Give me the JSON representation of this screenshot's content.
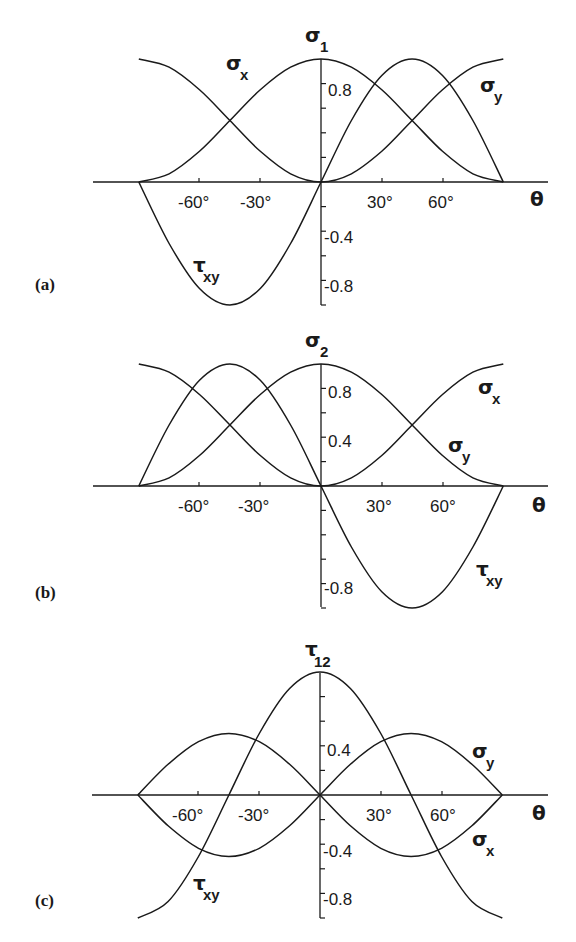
{
  "chart_data": [
    {
      "type": "line",
      "panel_label": "(a)",
      "title": "σ1",
      "ylabel": "σ1",
      "xlabel": "θ",
      "xlim": [
        -90,
        90
      ],
      "ylim": [
        -1.0,
        1.0
      ],
      "grid": false,
      "x_ticks": [
        -60,
        -30,
        30,
        60
      ],
      "x_tick_labels": [
        "-60°",
        "-30°",
        "30°",
        "60°"
      ],
      "y_ticks": [
        -0.8,
        -0.6,
        -0.4,
        -0.2,
        0.2,
        0.4,
        0.6,
        0.8
      ],
      "y_tick_labels": {
        "0.8": "0.8",
        "-0.4": "-0.4",
        "-0.8": "-0.8"
      },
      "x": [
        -90,
        -75,
        -60,
        -45,
        -30,
        -15,
        0,
        15,
        30,
        45,
        60,
        75,
        90
      ],
      "series": [
        {
          "name": "σx",
          "values": [
            0.0,
            0.067,
            0.25,
            0.5,
            0.75,
            0.933,
            1.0,
            0.933,
            0.75,
            0.5,
            0.25,
            0.067,
            0.0
          ]
        },
        {
          "name": "σy",
          "values": [
            1.0,
            0.933,
            0.75,
            0.5,
            0.25,
            0.067,
            0.0,
            0.067,
            0.25,
            0.5,
            0.75,
            0.933,
            1.0
          ]
        },
        {
          "name": "τxy",
          "values": [
            0.0,
            -0.5,
            -0.866,
            -1.0,
            -0.866,
            -0.5,
            0.0,
            0.5,
            0.866,
            1.0,
            0.866,
            0.5,
            0.0
          ]
        }
      ],
      "annotations": [
        {
          "text": "σx",
          "x": -42,
          "y": 0.88
        },
        {
          "text": "σy",
          "x": 78,
          "y": 0.75
        },
        {
          "text": "τxy",
          "x": -46,
          "y": -0.62
        }
      ]
    },
    {
      "type": "line",
      "panel_label": "(b)",
      "title": "σ2",
      "ylabel": "σ2",
      "xlabel": "θ",
      "xlim": [
        -90,
        90
      ],
      "ylim": [
        -1.0,
        1.0
      ],
      "grid": false,
      "x_ticks": [
        -60,
        -30,
        30,
        60
      ],
      "x_tick_labels": [
        "-60°",
        "-30°",
        "30°",
        "60°"
      ],
      "y_ticks": [
        -0.8,
        -0.6,
        -0.4,
        -0.2,
        0.2,
        0.4,
        0.6,
        0.8
      ],
      "y_tick_labels": {
        "0.8": "0.8",
        "0.4": "0.4",
        "-0.8": "-0.8"
      },
      "x": [
        -90,
        -75,
        -60,
        -45,
        -30,
        -15,
        0,
        15,
        30,
        45,
        60,
        75,
        90
      ],
      "series": [
        {
          "name": "σx",
          "values": [
            1.0,
            0.933,
            0.75,
            0.5,
            0.25,
            0.067,
            0.0,
            0.067,
            0.25,
            0.5,
            0.75,
            0.933,
            1.0
          ]
        },
        {
          "name": "σy",
          "values": [
            0.0,
            0.067,
            0.25,
            0.5,
            0.75,
            0.933,
            1.0,
            0.933,
            0.75,
            0.5,
            0.25,
            0.067,
            0.0
          ]
        },
        {
          "name": "τxy",
          "values": [
            0.0,
            0.5,
            0.866,
            1.0,
            0.866,
            0.5,
            0.0,
            -0.5,
            -0.866,
            -1.0,
            -0.866,
            -0.5,
            0.0
          ]
        }
      ],
      "annotations": [
        {
          "text": "σx",
          "x": 80,
          "y": 0.78
        },
        {
          "text": "σy",
          "x": 66,
          "y": 0.28
        },
        {
          "text": "τxy",
          "x": 80,
          "y": -0.7
        }
      ]
    },
    {
      "type": "line",
      "panel_label": "(c)",
      "title": "τ12",
      "ylabel": "τ12",
      "xlabel": "θ",
      "xlim": [
        -90,
        90
      ],
      "ylim": [
        -1.0,
        1.0
      ],
      "grid": false,
      "x_ticks": [
        -60,
        -30,
        30,
        60
      ],
      "x_tick_labels": [
        "-60°",
        "-30°",
        "30°",
        "60°"
      ],
      "y_ticks": [
        -0.8,
        -0.6,
        -0.4,
        -0.2,
        0.2,
        0.4,
        0.6,
        0.8
      ],
      "y_tick_labels": {
        "0.4": "0.4",
        "-0.4": "-0.4",
        "-0.8": "-0.8"
      },
      "x": [
        -90,
        -75,
        -60,
        -45,
        -30,
        -15,
        0,
        15,
        30,
        45,
        60,
        75,
        90
      ],
      "series": [
        {
          "name": "σx",
          "values": [
            0.0,
            0.25,
            0.433,
            0.5,
            0.433,
            0.25,
            0.0,
            -0.25,
            -0.433,
            -0.5,
            -0.433,
            -0.25,
            0.0
          ]
        },
        {
          "name": "σy",
          "values": [
            0.0,
            -0.25,
            -0.433,
            -0.5,
            -0.433,
            -0.25,
            0.0,
            0.25,
            0.433,
            0.5,
            0.433,
            0.25,
            0.0
          ]
        },
        {
          "name": "τxy",
          "values": [
            -1.0,
            -0.866,
            -0.5,
            0.0,
            0.5,
            0.866,
            1.0,
            0.866,
            0.5,
            0.0,
            -0.5,
            -0.866,
            -1.0
          ]
        }
      ],
      "annotations": [
        {
          "text": "σy",
          "x": 80,
          "y": 0.3
        },
        {
          "text": "σx",
          "x": 80,
          "y": -0.4
        },
        {
          "text": "τxy",
          "x": -46,
          "y": -0.75
        }
      ]
    }
  ],
  "panels": [
    {
      "label": "(a)",
      "ysym": "σ",
      "ysub": "1",
      "xsym": "θ",
      "curve_labels": [
        {
          "sym": "σ",
          "sub": "x"
        },
        {
          "sym": "σ",
          "sub": "y"
        },
        {
          "sym": "τ",
          "sub": "xy"
        }
      ],
      "ticks": {
        "m60": "-60°",
        "m30": "-30°",
        "p30": "30°",
        "p60": "60°"
      },
      "yt1": "0.8",
      "yt2": "-0.4",
      "yt3": "-0.8"
    },
    {
      "label": "(b)",
      "ysym": "σ",
      "ysub": "2",
      "xsym": "θ",
      "curve_labels": [
        {
          "sym": "σ",
          "sub": "x"
        },
        {
          "sym": "σ",
          "sub": "y"
        },
        {
          "sym": "τ",
          "sub": "xy"
        }
      ],
      "ticks": {
        "m60": "-60°",
        "m30": "-30°",
        "p30": "30°",
        "p60": "60°"
      },
      "yt1": "0.8",
      "yt2": "0.4",
      "yt3": "-0.8"
    },
    {
      "label": "(c)",
      "ysym": "τ",
      "ysub": "12",
      "xsym": "θ",
      "curve_labels": [
        {
          "sym": "σ",
          "sub": "y"
        },
        {
          "sym": "σ",
          "sub": "x"
        },
        {
          "sym": "τ",
          "sub": "xy"
        }
      ],
      "ticks": {
        "m60": "-60°",
        "m30": "-30°",
        "p30": "30°",
        "p60": "60°"
      },
      "yt1": "0.4",
      "yt2": "-0.4",
      "yt3": "-0.8"
    }
  ]
}
